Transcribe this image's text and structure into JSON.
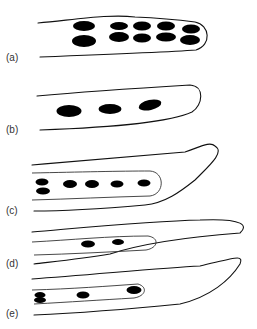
{
  "figure": {
    "panels": [
      {
        "id": "a",
        "label": "(a)",
        "description": "Cell with two rows of paired nuclei (10 nuclei)"
      },
      {
        "id": "b",
        "label": "(b)",
        "description": "Cell with three single nuclei in a row"
      },
      {
        "id": "c",
        "label": "(c)",
        "description": "Elongated cell with inner compartment containing paired nuclei and four single nuclei"
      },
      {
        "id": "d",
        "label": "(d)",
        "description": "Elongated cell with inner compartment containing two nuclei"
      },
      {
        "id": "e",
        "label": "(e)",
        "description": "Elongated cell with inner compartment containing paired nucleus and two single nuclei"
      }
    ]
  }
}
